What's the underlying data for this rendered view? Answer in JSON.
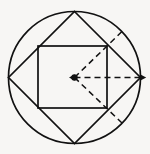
{
  "figure": {
    "caption": "",
    "background_color": "#f7f6f4",
    "stroke_color": "#111111"
  },
  "geometry": {
    "canvas": {
      "width": 150,
      "height": 154
    },
    "circle": {
      "name": "outer-circle",
      "cx": 74.5,
      "cy": 77.5,
      "r": 66,
      "style": "solid"
    },
    "diamond": {
      "name": "inscribed-diamond",
      "style": "solid",
      "vertices": [
        {
          "label": "top",
          "x": 74.5,
          "y": 11.5
        },
        {
          "label": "right",
          "x": 140.5,
          "y": 77.5
        },
        {
          "label": "bottom",
          "x": 74.5,
          "y": 143.5
        },
        {
          "label": "left",
          "x": 8.5,
          "y": 77.5
        }
      ]
    },
    "square": {
      "name": "inner-square",
      "style": "solid",
      "x": 38,
      "y": 46,
      "width": 69,
      "height": 62,
      "corners": [
        {
          "label": "top-left",
          "x": 38,
          "y": 46
        },
        {
          "label": "top-right",
          "x": 107,
          "y": 46
        },
        {
          "label": "bottom-right",
          "x": 107,
          "y": 108
        },
        {
          "label": "bottom-left",
          "x": 38,
          "y": 108
        }
      ]
    },
    "center_point": {
      "name": "center-dot",
      "x": 74.5,
      "y": 77.5,
      "radius": 3.2
    },
    "rays": [
      {
        "name": "radius-arrow-horizontal",
        "style": "dashed",
        "from": {
          "x": 74.5,
          "y": 77.5
        },
        "to": {
          "x": 140.5,
          "y": 77.5
        },
        "arrowheads": "both",
        "dash_pattern": "6 4"
      },
      {
        "name": "diagonal-ray-upper-right",
        "style": "dashed",
        "from": {
          "x": 74.5,
          "y": 77.5
        },
        "to": {
          "x": 122.0,
          "y": 31.5
        },
        "arrowheads": "none",
        "dash_pattern": "6 4",
        "passes_through": {
          "label": "square-top-right",
          "x": 107,
          "y": 46
        }
      },
      {
        "name": "diagonal-ray-lower-right",
        "style": "dashed",
        "from": {
          "x": 74.5,
          "y": 77.5
        },
        "to": {
          "x": 122.0,
          "y": 123.0
        },
        "arrowheads": "none",
        "dash_pattern": "6 4",
        "passes_through": {
          "label": "square-bottom-right",
          "x": 107,
          "y": 108
        }
      }
    ]
  }
}
